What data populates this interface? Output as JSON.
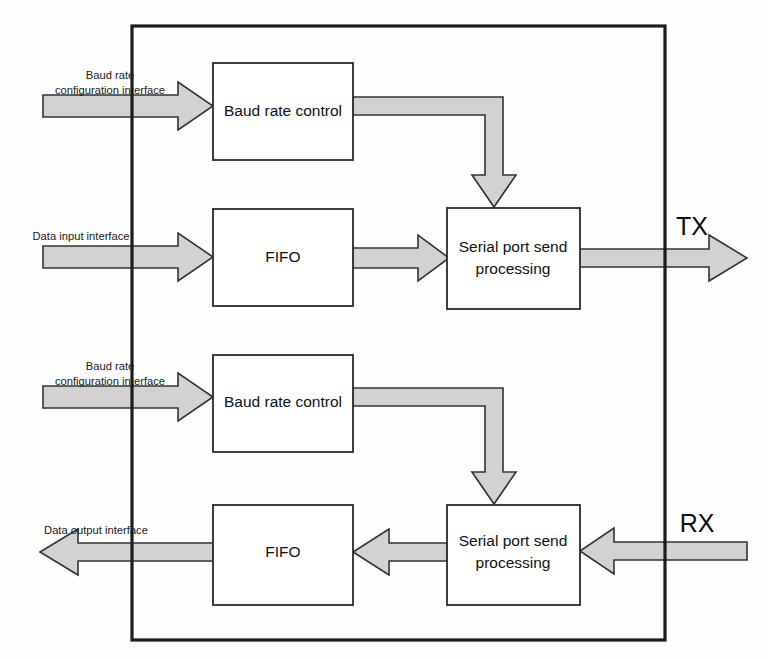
{
  "diagram": {
    "type": "block-diagram",
    "background_color": "#ffffff",
    "frame": {
      "name": "module boundary",
      "stroke_color": "#1c1c1c"
    },
    "style": {
      "arrow_fill": "#d2d2d2",
      "arrow_stroke": "#333333",
      "block_stroke": "#2b2b2b",
      "block_fill": "#ffffff",
      "text_color": "#111111"
    },
    "blocks": [
      {
        "id": "tx-baud-rate-control",
        "label": "Baud rate control"
      },
      {
        "id": "tx-fifo",
        "label": "FIFO"
      },
      {
        "id": "tx-serial-port-processing",
        "label": "Serial port send\nprocessing",
        "line1": "Serial port send",
        "line2": "processing"
      },
      {
        "id": "rx-baud-rate-control",
        "label": "Baud rate control"
      },
      {
        "id": "rx-fifo",
        "label": "FIFO"
      },
      {
        "id": "rx-serial-port-processing",
        "label": "Serial port send\nprocessing",
        "line1": "Serial port send",
        "line2": "processing"
      }
    ],
    "interface_labels": {
      "tx_baud_config_line1": "Baud rate",
      "tx_baud_config_line2": "configuration interface",
      "data_input": "Data input interface",
      "rx_baud_config_line1": "Baud rate",
      "rx_baud_config_line2": "configuration interface",
      "data_output": "Data output interface"
    },
    "port_labels": {
      "tx": "TX",
      "rx": "RX"
    },
    "connections": [
      {
        "id": "conn-baud-config-tx",
        "from": "Baud rate configuration interface",
        "to": "Baud rate control",
        "direction": "right"
      },
      {
        "id": "conn-baud-to-send-tx",
        "from": "Baud rate control",
        "to": "Serial port send processing",
        "direction": "right-then-down"
      },
      {
        "id": "conn-data-in-fifo",
        "from": "Data input interface",
        "to": "FIFO",
        "direction": "right"
      },
      {
        "id": "conn-fifo-to-send-tx",
        "from": "FIFO",
        "to": "Serial port send processing",
        "direction": "right"
      },
      {
        "id": "conn-send-to-tx",
        "from": "Serial port send processing",
        "to": "TX",
        "direction": "right"
      },
      {
        "id": "conn-baud-config-rx",
        "from": "Baud rate configuration interface",
        "to": "Baud rate control",
        "direction": "right"
      },
      {
        "id": "conn-baud-to-send-rx",
        "from": "Baud rate control",
        "to": "Serial port send processing",
        "direction": "right-then-down"
      },
      {
        "id": "conn-rx-to-send",
        "from": "RX",
        "to": "Serial port send processing",
        "direction": "left"
      },
      {
        "id": "conn-send-to-fifo-rx",
        "from": "Serial port send processing",
        "to": "FIFO",
        "direction": "left"
      },
      {
        "id": "conn-fifo-to-data-out",
        "from": "FIFO",
        "to": "Data output interface",
        "direction": "left"
      }
    ]
  }
}
